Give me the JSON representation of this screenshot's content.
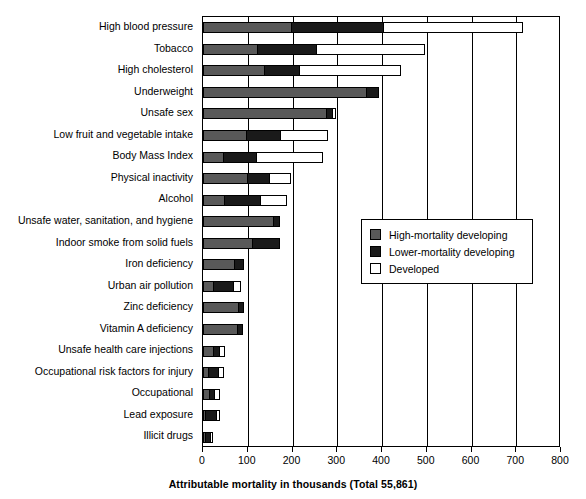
{
  "chart_data": {
    "type": "bar",
    "orientation": "horizontal",
    "stacked": true,
    "title": "",
    "xlabel": "Attributable mortality in thousands (Total 55,861)",
    "ylabel": "",
    "xlim": [
      0,
      800
    ],
    "xticks": [
      0,
      100,
      200,
      300,
      400,
      500,
      600,
      700,
      800
    ],
    "grid": "vertical",
    "legend_position": "middle-right",
    "categories": [
      "High blood pressure",
      "Tobacco",
      "High cholesterol",
      "Underweight",
      "Unsafe sex",
      "Low fruit and vegetable intake",
      "Body Mass Index",
      "Physical inactivity",
      "Alcohol",
      "Unsafe water, sanitation, and hygiene",
      "Indoor smoke from solid fuels",
      "Iron deficiency",
      "Urban air pollution",
      "Zinc deficiency",
      "Vitamin A deficiency",
      "Unsafe health care injections",
      "Occupational risk factors for injury",
      "Occupational",
      "Lead exposure",
      "Illicit drugs"
    ],
    "series": [
      {
        "name": "High-mortality developing",
        "color": "#595959",
        "values": [
          197,
          121,
          137,
          364,
          275,
          96,
          45,
          98,
          46,
          157,
          110,
          69,
          23,
          78,
          76,
          23,
          11,
          13,
          5,
          5
        ]
      },
      {
        "name": "Lower-mortality developing",
        "color": "#1a1a1a",
        "values": [
          205,
          132,
          78,
          27,
          13,
          76,
          73,
          49,
          81,
          13,
          60,
          20,
          43,
          11,
          11,
          13,
          22,
          12,
          24,
          10
        ]
      },
      {
        "name": "Developed",
        "color": "#ffffff",
        "values": [
          311,
          241,
          225,
          0,
          8,
          105,
          149,
          48,
          58,
          0,
          0,
          0,
          17,
          0,
          0,
          12,
          11,
          11,
          7,
          5
        ]
      }
    ],
    "totals": [
      713,
      494,
      440,
      391,
      296,
      277,
      267,
      195,
      185,
      170,
      170,
      89,
      83,
      89,
      87,
      48,
      44,
      36,
      36,
      20
    ]
  },
  "legend": {
    "items": [
      {
        "label": "High-mortality developing",
        "swatch": "high"
      },
      {
        "label": "Lower-mortality developing",
        "swatch": "lower"
      },
      {
        "label": "Developed",
        "swatch": "dev"
      }
    ]
  }
}
